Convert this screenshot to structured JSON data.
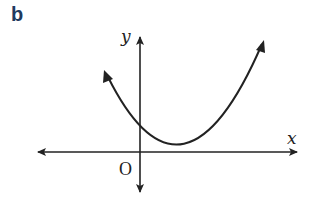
{
  "figure": {
    "label": "b",
    "label_color": "#1f3a60",
    "x_axis_label": "x",
    "y_axis_label": "y",
    "origin_label": "O",
    "curve": "upward parabola touching x-axis at a single point to the right of origin, positive y-intercept",
    "line_color": "#222222"
  }
}
